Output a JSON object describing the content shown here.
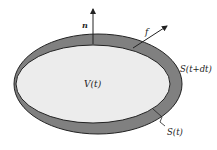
{
  "diagram": {
    "labels": {
      "normal": "n",
      "force": "f",
      "volume": "V(t)",
      "outer_surface": "S(t+dt)",
      "inner_surface": "S(t)"
    },
    "colors": {
      "shell": "#7a7a7a",
      "interior": "#ececec",
      "stroke": "#222222"
    }
  }
}
